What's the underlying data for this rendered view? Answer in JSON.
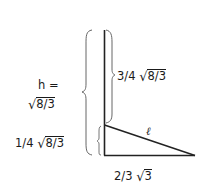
{
  "diagram": {
    "labels": {
      "h_eq": "h =",
      "h_value": {
        "radical": "√",
        "arg": "8/3"
      },
      "upper_segment": {
        "coef": "3/4 ",
        "radical": "√",
        "arg": "8/3"
      },
      "lower_segment": {
        "coef": "1/4 ",
        "radical": "√",
        "arg": "8/3"
      },
      "base": {
        "coef": "2/3 ",
        "radical": "√",
        "arg": "3"
      },
      "hypotenuse": "ℓ"
    },
    "colors": {
      "stroke": "#222222",
      "brace": "#666666",
      "text": "#1a1a1a"
    }
  }
}
